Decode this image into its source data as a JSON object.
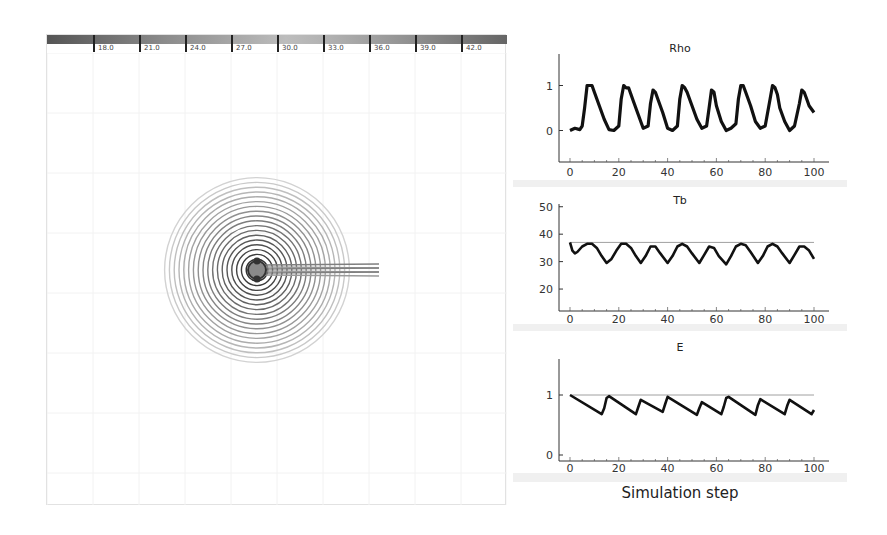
{
  "colorbar": {
    "ticks": [
      "18.0",
      "21.0",
      "24.0",
      "27.0",
      "30.0",
      "33.0",
      "36.0",
      "39.0",
      "42.0"
    ]
  },
  "simulation_view": {
    "center": [
      210,
      217
    ],
    "ring_count": 18,
    "trail_direction": "right"
  },
  "charts_panel": {
    "xlabel": "Simulation step"
  },
  "chart_data": [
    {
      "type": "line",
      "title": "Rho",
      "xlabel": "",
      "ylabel": "",
      "xlim": [
        0,
        100
      ],
      "ylim": [
        -0.7,
        1.7
      ],
      "xticks": [
        0,
        20,
        40,
        60,
        80,
        100
      ],
      "yticks": [
        0,
        1
      ],
      "x": [
        0,
        2,
        4,
        5,
        6,
        7,
        8,
        9,
        10,
        12,
        14,
        16,
        18,
        20,
        21,
        22,
        23,
        24,
        26,
        28,
        30,
        32,
        33,
        34,
        35,
        36,
        38,
        40,
        42,
        44,
        45,
        46,
        47,
        48,
        50,
        52,
        54,
        56,
        57,
        58,
        59,
        60,
        62,
        64,
        66,
        68,
        69,
        70,
        71,
        72,
        74,
        76,
        78,
        80,
        82,
        83,
        84,
        85,
        86,
        88,
        90,
        92,
        94,
        95,
        96,
        97,
        98,
        100
      ],
      "values": [
        0,
        0.05,
        0.02,
        0.1,
        0.5,
        1.0,
        1.0,
        1.0,
        0.85,
        0.55,
        0.25,
        0.02,
        0.0,
        0.1,
        0.7,
        1.0,
        0.95,
        0.95,
        0.65,
        0.35,
        0.05,
        0.1,
        0.6,
        0.9,
        0.85,
        0.7,
        0.4,
        0.05,
        0.0,
        0.1,
        0.7,
        1.0,
        0.95,
        0.85,
        0.55,
        0.25,
        0.05,
        0.1,
        0.5,
        0.9,
        0.85,
        0.55,
        0.2,
        0.0,
        0.05,
        0.15,
        0.7,
        1.0,
        1.0,
        0.85,
        0.55,
        0.2,
        0.05,
        0.1,
        0.7,
        1.0,
        0.95,
        0.8,
        0.5,
        0.2,
        0.0,
        0.1,
        0.6,
        0.9,
        0.85,
        0.7,
        0.55,
        0.4
      ],
      "grid": false
    },
    {
      "type": "line",
      "title": "Tb",
      "xlabel": "",
      "ylabel": "",
      "xlim": [
        0,
        100
      ],
      "ylim": [
        12,
        51
      ],
      "xticks": [
        0,
        20,
        40,
        60,
        80,
        100
      ],
      "yticks": [
        20,
        30,
        40,
        50
      ],
      "reference_line": 37,
      "x": [
        0,
        1,
        2,
        3,
        5,
        7,
        9,
        11,
        13,
        15,
        17,
        19,
        21,
        23,
        25,
        27,
        29,
        31,
        33,
        35,
        37,
        40,
        42,
        44,
        46,
        48,
        50,
        53,
        55,
        57,
        59,
        61,
        64,
        66,
        68,
        70,
        72,
        74,
        77,
        79,
        81,
        83,
        85,
        87,
        90,
        92,
        94,
        96,
        98,
        100
      ],
      "values": [
        37,
        34,
        33,
        33.5,
        35.5,
        36.5,
        36.5,
        35,
        32,
        29.5,
        31,
        34,
        36.5,
        36.5,
        35,
        32,
        29.5,
        32,
        35.5,
        35.5,
        33,
        29.5,
        32,
        35.5,
        36.5,
        35.5,
        33,
        29.5,
        32.5,
        35.5,
        35,
        32,
        29,
        32,
        35.5,
        36.5,
        36,
        33.5,
        29.5,
        32,
        35.5,
        36.5,
        35.5,
        33,
        29.5,
        32.5,
        35.5,
        35.5,
        34,
        31
      ],
      "grid": false
    },
    {
      "type": "line",
      "title": "E",
      "xlabel": "Simulation step",
      "ylabel": "",
      "xlim": [
        0,
        100
      ],
      "ylim": [
        -0.1,
        1.6
      ],
      "xticks": [
        0,
        20,
        40,
        60,
        80,
        100
      ],
      "yticks": [
        0,
        1
      ],
      "reference_line": 1,
      "x": [
        0,
        13,
        14,
        15,
        16,
        27,
        28,
        29,
        38,
        39,
        40,
        52,
        53,
        54,
        62,
        63,
        64,
        65,
        76,
        77,
        78,
        88,
        89,
        90,
        99,
        100
      ],
      "values": [
        1,
        0.68,
        0.78,
        0.95,
        0.98,
        0.68,
        0.8,
        0.92,
        0.72,
        0.85,
        0.97,
        0.67,
        0.78,
        0.88,
        0.68,
        0.8,
        0.95,
        0.97,
        0.67,
        0.83,
        0.93,
        0.68,
        0.82,
        0.92,
        0.68,
        0.75
      ],
      "grid": false
    }
  ]
}
